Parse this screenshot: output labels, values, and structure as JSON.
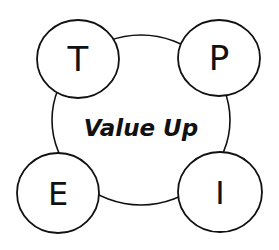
{
  "diagram": {
    "center": {
      "label": "Value Up",
      "cx": 141,
      "cy": 120,
      "rx": 89,
      "ry": 85
    },
    "nodes": [
      {
        "id": "T",
        "label": "T",
        "cx": 78,
        "cy": 59,
        "rx": 41,
        "ry": 39
      },
      {
        "id": "P",
        "label": "P",
        "cx": 219,
        "cy": 58,
        "rx": 41,
        "ry": 38
      },
      {
        "id": "E",
        "label": "E",
        "cx": 58,
        "cy": 193,
        "rx": 41,
        "ry": 40
      },
      {
        "id": "I",
        "label": "I",
        "cx": 220,
        "cy": 192,
        "rx": 42,
        "ry": 40
      }
    ],
    "stroke_color": "#111111",
    "fill_color": "#ffffff"
  }
}
